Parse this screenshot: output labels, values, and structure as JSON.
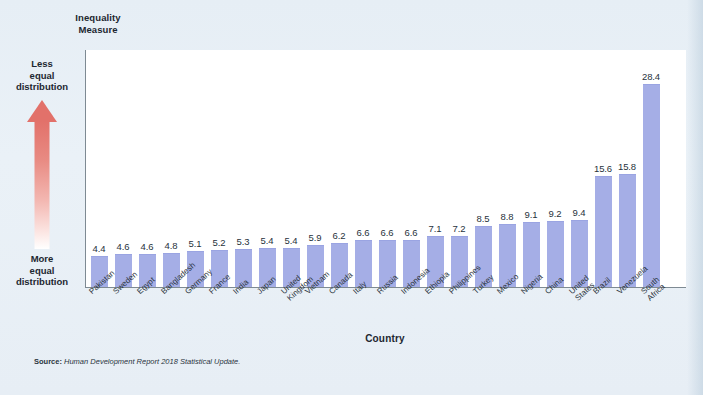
{
  "chart_data": {
    "type": "bar",
    "title": "",
    "subtitle": "",
    "xlabel": "Country",
    "ylabel": "Inequality Measure",
    "ylim": [
      0,
      30
    ],
    "grid": false,
    "legend": "none",
    "bar_color": "#a5aee6",
    "plot_background": "#ffffff",
    "page_background": "#e9f0f6",
    "categories": [
      "Pakistan",
      "Sweden",
      "Egypt",
      "Bangladesh",
      "Germany",
      "France",
      "India",
      "Japan",
      "United\nKingdom",
      "Vietnam",
      "Canada",
      "Italy",
      "Russia",
      "Indonesia",
      "Ethiopia",
      "Philippines",
      "Turkey",
      "Mexico",
      "Nigeria",
      "China",
      "United States",
      "Brazil",
      "Venezuela",
      "South Africa"
    ],
    "values": [
      4.4,
      4.6,
      4.6,
      4.8,
      5.1,
      5.2,
      5.3,
      5.4,
      5.4,
      5.9,
      6.2,
      6.6,
      6.6,
      6.6,
      7.1,
      7.2,
      8.5,
      8.8,
      9.1,
      9.2,
      9.4,
      15.6,
      15.8,
      28.4
    ],
    "annotations": [
      {
        "text": "Less equal distribution",
        "position": "axis-top-left"
      },
      {
        "text": "More equal distribution",
        "position": "axis-bottom-left"
      }
    ]
  },
  "axes": {
    "y_title_line1": "Inequality",
    "y_title_line2": "Measure",
    "x_title": "Country"
  },
  "annotations": {
    "top_line1": "Less",
    "top_line2": "equal",
    "top_line3": "distribution",
    "bottom_line1": "More",
    "bottom_line2": "equal",
    "bottom_line3": "distribution",
    "arrow_color_top": "#e2716a",
    "arrow_color_bottom": "#ffffff"
  },
  "source": {
    "label": "Source:",
    "text": "Human Development Report 2018 Statistical Update."
  }
}
